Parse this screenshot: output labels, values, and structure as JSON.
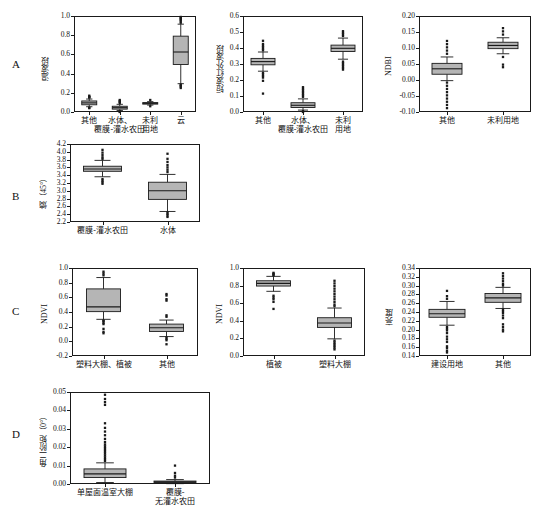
{
  "figure": {
    "panels": [
      {
        "letter": "A",
        "plots": [
          {
            "id": "a1",
            "ylabel": "温波段",
            "ymin": 0.0,
            "ymax": 1.0,
            "yticks": [
              "0.0",
              "0.2",
              "0.4",
              "0.6",
              "0.8",
              "1.0"
            ],
            "ytickvals": [
              0.0,
              0.2,
              0.4,
              0.6,
              0.8,
              1.0
            ],
            "categories": [
              "其他",
              "水体、\n覆膜-灌水农田",
              "未利\n用地",
              "云"
            ],
            "boxes": [
              {
                "q1": 0.075,
                "median": 0.095,
                "q3": 0.115,
                "whisker_low": 0.055,
                "whisker_high": 0.135,
                "outliers": [
                  0.04,
                  0.045,
                  0.15,
                  0.155,
                  0.16,
                  0.17
                ]
              },
              {
                "q1": 0.03,
                "median": 0.045,
                "q3": 0.06,
                "whisker_low": 0.015,
                "whisker_high": 0.08,
                "outliers": [
                  0.0,
                  0.005,
                  0.095,
                  0.105,
                  0.115,
                  0.125
                ]
              },
              {
                "q1": 0.082,
                "median": 0.09,
                "q3": 0.098,
                "whisker_low": 0.072,
                "whisker_high": 0.108,
                "outliers": [
                  0.06,
                  0.125
                ]
              },
              {
                "q1": 0.495,
                "median": 0.625,
                "q3": 0.79,
                "whisker_low": 0.295,
                "whisker_high": 0.915,
                "outliers": [
                  0.25,
                  0.265,
                  0.275,
                  0.285,
                  0.93,
                  0.945,
                  0.96,
                  0.97,
                  0.98,
                  0.99
                ]
              }
            ]
          },
          {
            "id": "a2",
            "ylabel": "短波红外波段",
            "ymin": 0.0,
            "ymax": 0.6,
            "yticks": [
              "0.0",
              "0.1",
              "0.2",
              "0.3",
              "0.4",
              "0.5",
              "0.6"
            ],
            "ytickvals": [
              0.0,
              0.1,
              0.2,
              0.3,
              0.4,
              0.5,
              0.6
            ],
            "categories": [
              "其他",
              "水体、\n覆膜-灌水农田",
              "未利\n用地"
            ],
            "boxes": [
              {
                "q1": 0.295,
                "median": 0.315,
                "q3": 0.335,
                "whisker_low": 0.255,
                "whisker_high": 0.375,
                "outliers": [
                  0.115,
                  0.195,
                  0.215,
                  0.225,
                  0.235,
                  0.245,
                  0.385,
                  0.395,
                  0.405,
                  0.415,
                  0.425,
                  0.445
                ]
              },
              {
                "q1": 0.028,
                "median": 0.042,
                "q3": 0.058,
                "whisker_low": 0.012,
                "whisker_high": 0.082,
                "outliers": [
                  0.0,
                  0.005,
                  0.095,
                  0.105,
                  0.115,
                  0.125,
                  0.135,
                  0.145,
                  0.155
                ]
              },
              {
                "q1": 0.378,
                "median": 0.398,
                "q3": 0.418,
                "whisker_low": 0.33,
                "whisker_high": 0.462,
                "outliers": [
                  0.265,
                  0.275,
                  0.285,
                  0.295,
                  0.305,
                  0.315,
                  0.475,
                  0.485,
                  0.495,
                  0.505
                ]
              }
            ]
          },
          {
            "id": "a3",
            "ylabel": "NDBI",
            "ymin": -0.1,
            "ymax": 0.2,
            "yticks": [
              "-0.10",
              "-0.05",
              "0.00",
              "0.05",
              "0.10",
              "0.15",
              "0.20"
            ],
            "ytickvals": [
              -0.1,
              -0.05,
              0.0,
              0.05,
              0.1,
              0.15,
              0.2
            ],
            "categories": [
              "其他",
              "未利用地"
            ],
            "boxes": [
              {
                "q1": 0.018,
                "median": 0.035,
                "q3": 0.052,
                "whisker_low": -0.002,
                "whisker_high": 0.072,
                "outliers": [
                  -0.088,
                  -0.078,
                  -0.068,
                  -0.058,
                  -0.048,
                  -0.038,
                  -0.028,
                  -0.018,
                  -0.008,
                  0.082,
                  0.092,
                  0.102,
                  0.112,
                  0.122
                ]
              },
              {
                "q1": 0.098,
                "median": 0.108,
                "q3": 0.118,
                "whisker_low": 0.082,
                "whisker_high": 0.132,
                "outliers": [
                  0.04,
                  0.048,
                  0.072,
                  0.142,
                  0.152,
                  0.162
                ]
              }
            ]
          }
        ]
      },
      {
        "letter": "B",
        "plots": [
          {
            "id": "b1",
            "ylabel": "熵（45°）",
            "ymin": 2.2,
            "ymax": 4.2,
            "yticks": [
              "2.2",
              "2.4",
              "2.6",
              "2.8",
              "3.0",
              "3.2",
              "3.4",
              "3.6",
              "3.8",
              "4.0",
              "4.2"
            ],
            "ytickvals": [
              2.2,
              2.4,
              2.6,
              2.8,
              3.0,
              3.2,
              3.4,
              3.6,
              3.8,
              4.0,
              4.2
            ],
            "categories": [
              "覆膜-灌水农田",
              "水体"
            ],
            "boxes": [
              {
                "q1": 3.5,
                "median": 3.56,
                "q3": 3.63,
                "whisker_low": 3.36,
                "whisker_high": 3.78,
                "outliers": [
                  3.18,
                  3.22,
                  3.26,
                  3.3,
                  3.82,
                  3.86,
                  3.92,
                  3.98,
                  4.05
                ]
              },
              {
                "q1": 2.78,
                "median": 3.0,
                "q3": 3.22,
                "whisker_low": 2.47,
                "whisker_high": 3.42,
                "outliers": [
                  2.33,
                  2.37,
                  2.41,
                  2.45,
                  3.48,
                  3.54,
                  3.6,
                  3.66,
                  3.74,
                  3.82,
                  3.95
                ]
              }
            ]
          }
        ]
      },
      {
        "letter": "C",
        "plots": [
          {
            "id": "c1",
            "ylabel": "NDVI",
            "ymin": -0.2,
            "ymax": 1.0,
            "yticks": [
              "-0.2",
              "0.0",
              "0.2",
              "0.4",
              "0.6",
              "0.8",
              "1.0"
            ],
            "ytickvals": [
              -0.2,
              0.0,
              0.2,
              0.4,
              0.6,
              0.8,
              1.0
            ],
            "categories": [
              "塑料大棚、植被",
              "其他"
            ],
            "boxes": [
              {
                "q1": 0.405,
                "median": 0.47,
                "q3": 0.715,
                "whisker_low": 0.3,
                "whisker_high": 0.87,
                "outliers": [
                  0.11,
                  0.13,
                  0.17,
                  0.235,
                  0.255,
                  0.275,
                  0.285,
                  0.9,
                  0.925,
                  0.95
                ]
              },
              {
                "q1": 0.135,
                "median": 0.185,
                "q3": 0.235,
                "whisker_low": 0.065,
                "whisker_high": 0.29,
                "outliers": [
                  -0.04,
                  0.015,
                  0.035,
                  0.055,
                  0.335,
                  0.355,
                  0.555,
                  0.575,
                  0.625,
                  0.645
                ]
              }
            ]
          },
          {
            "id": "c2",
            "ylabel": "NDVI",
            "ymin": 0.0,
            "ymax": 1.0,
            "yticks": [
              "0.0",
              "0.2",
              "0.4",
              "0.6",
              "0.8",
              "1.0"
            ],
            "ytickvals": [
              0.0,
              0.2,
              0.4,
              0.6,
              0.8,
              1.0
            ],
            "categories": [
              "植被",
              "塑料大棚"
            ],
            "boxes": [
              {
                "q1": 0.795,
                "median": 0.825,
                "q3": 0.855,
                "whisker_low": 0.735,
                "whisker_high": 0.905,
                "outliers": [
                  0.535,
                  0.615,
                  0.645,
                  0.665,
                  0.685,
                  0.915,
                  0.925,
                  0.935,
                  0.945
                ]
              },
              {
                "q1": 0.325,
                "median": 0.375,
                "q3": 0.435,
                "whisker_low": 0.195,
                "whisker_high": 0.545,
                "outliers": [
                  0.075,
                  0.095,
                  0.115,
                  0.135,
                  0.155,
                  0.175,
                  0.565,
                  0.585,
                  0.615,
                  0.645,
                  0.675,
                  0.705,
                  0.735,
                  0.765,
                  0.795,
                  0.825,
                  0.855
                ]
              }
            ]
          },
          {
            "id": "c3",
            "ylabel": "亮度",
            "ymin": 0.14,
            "ymax": 0.34,
            "yticks": [
              "0.14",
              "0.16",
              "0.18",
              "0.20",
              "0.22",
              "0.24",
              "0.26",
              "0.28",
              "0.30",
              "0.32",
              "0.34"
            ],
            "ytickvals": [
              0.14,
              0.16,
              0.18,
              0.2,
              0.22,
              0.24,
              0.26,
              0.28,
              0.3,
              0.32,
              0.34
            ],
            "categories": [
              "建设用地",
              "其他"
            ],
            "boxes": [
              {
                "q1": 0.228,
                "median": 0.236,
                "q3": 0.246,
                "whisker_low": 0.21,
                "whisker_high": 0.264,
                "outliers": [
                  0.148,
                  0.152,
                  0.158,
                  0.162,
                  0.172,
                  0.178,
                  0.184,
                  0.192,
                  0.198,
                  0.202,
                  0.206,
                  0.27,
                  0.276,
                  0.288
                ]
              },
              {
                "q1": 0.262,
                "median": 0.272,
                "q3": 0.282,
                "whisker_low": 0.248,
                "whisker_high": 0.296,
                "outliers": [
                  0.196,
                  0.2,
                  0.206,
                  0.212,
                  0.226,
                  0.232,
                  0.238,
                  0.242,
                  0.246,
                  0.3,
                  0.304,
                  0.31,
                  0.316,
                  0.322,
                  0.328
                ]
              }
            ]
          }
        ]
      },
      {
        "letter": "D",
        "plots": [
          {
            "id": "d1",
            "ylabel": "角二阶矩（0°）",
            "ymin": 0.0,
            "ymax": 0.05,
            "yticks": [
              "0.00",
              "0.01",
              "0.02",
              "0.03",
              "0.04",
              "0.05"
            ],
            "ytickvals": [
              0.0,
              0.01,
              0.02,
              0.03,
              0.04,
              0.05
            ],
            "categories": [
              "单屋面温室大棚",
              "覆膜-\n无灌水农田"
            ],
            "boxes": [
              {
                "q1": 0.0035,
                "median": 0.0055,
                "q3": 0.0082,
                "whisker_low": 0.0008,
                "whisker_high": 0.0115,
                "outliers": [
                  0.0125,
                  0.0135,
                  0.0145,
                  0.0155,
                  0.0165,
                  0.0175,
                  0.0185,
                  0.0195,
                  0.0205,
                  0.0215,
                  0.0228,
                  0.0245,
                  0.0265,
                  0.0285,
                  0.0305,
                  0.033,
                  0.043,
                  0.0445,
                  0.0462,
                  0.0485
                ]
              },
              {
                "q1": 0.0008,
                "median": 0.0012,
                "q3": 0.0016,
                "whisker_low": 0.0002,
                "whisker_high": 0.0024,
                "outliers": [
                  0.0035,
                  0.0045,
                  0.006,
                  0.01
                ]
              }
            ]
          }
        ]
      }
    ]
  },
  "style": {
    "box_fill": "#b5b5b5",
    "line_color": "#1a1a1a",
    "background": "#ffffff"
  }
}
